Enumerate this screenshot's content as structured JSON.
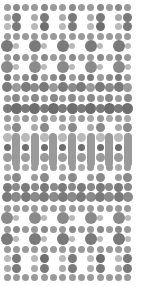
{
  "canvas": {
    "width": 146,
    "height": 285,
    "background": "#ffffff",
    "title": "grayscale-dot-matrix-pattern"
  },
  "grid": {
    "origin_x": 7,
    "origin_y": 7,
    "step_x": 9.3,
    "step_y": 9.4,
    "columns": 14,
    "rows": 29
  },
  "palette": {
    "light": "#b9b9b9",
    "light_mid": "#a9a9a9",
    "mid": "#9a9a9a",
    "mid_dark": "#8a8a8a",
    "dark": "#7a7a7a",
    "darkest": "#6e6e6e"
  },
  "chart_data": {
    "type": "heatmap",
    "xlabel": "",
    "ylabel": "",
    "categories": [
      "c0",
      "c1",
      "c2",
      "c3",
      "c4",
      "c5",
      "c6",
      "c7",
      "c8",
      "c9",
      "c10",
      "c11",
      "c12",
      "c13"
    ],
    "legend_position": "none",
    "grid": false,
    "note": "Each cell is a circle whose radius encodes size value and fill encodes tone value. Rows 14-16 contain vertical capsule glyphs in alternating columns.",
    "rows": [
      {
        "y": 7,
        "sizes": [
          7,
          7,
          7,
          7,
          7,
          7,
          7,
          7,
          7,
          7,
          7,
          7,
          7,
          7
        ],
        "tones": [
          "mid",
          "mid_dark",
          "mid",
          "mid",
          "mid_dark",
          "mid",
          "mid",
          "mid_dark",
          "mid",
          "mid",
          "mid_dark",
          "mid",
          "mid_dark",
          "mid"
        ]
      },
      {
        "y": 17,
        "sizes": [
          7,
          9,
          0,
          7,
          9,
          0,
          7,
          9,
          0,
          7,
          9,
          0,
          7,
          9
        ],
        "tones": [
          "light_mid",
          "dark",
          "none",
          "light_mid",
          "dark",
          "none",
          "light_mid",
          "dark",
          "none",
          "light_mid",
          "dark",
          "none",
          "light_mid",
          "dark"
        ]
      },
      {
        "y": 26,
        "sizes": [
          7,
          9,
          0,
          7,
          9,
          0,
          7,
          9,
          0,
          7,
          9,
          0,
          7,
          9
        ],
        "tones": [
          "light",
          "dark",
          "none",
          "light",
          "darkest",
          "none",
          "light",
          "dark",
          "none",
          "light",
          "darkest",
          "none",
          "light",
          "dark"
        ]
      },
      {
        "y": 36,
        "sizes": [
          7,
          7,
          7,
          7,
          7,
          7,
          7,
          7,
          7,
          7,
          7,
          7,
          7,
          7
        ],
        "tones": [
          "mid",
          "mid",
          "mid",
          "mid",
          "mid",
          "mid",
          "mid",
          "mid",
          "mid",
          "mid",
          "mid",
          "mid",
          "mid",
          "mid"
        ]
      },
      {
        "y": 46,
        "sizes": [
          12,
          6,
          0,
          12,
          6,
          0,
          12,
          6,
          0,
          12,
          6,
          0,
          12,
          6
        ],
        "tones": [
          "dark",
          "light",
          "none",
          "dark",
          "light",
          "none",
          "dark",
          "light",
          "none",
          "dark",
          "light",
          "none",
          "dark",
          "light"
        ]
      },
      {
        "y": 57,
        "sizes": [
          7,
          7,
          7,
          7,
          7,
          7,
          7,
          7,
          7,
          7,
          7,
          7,
          7,
          7
        ],
        "tones": [
          "mid",
          "mid_dark",
          "mid",
          "mid",
          "mid_dark",
          "mid",
          "mid",
          "mid_dark",
          "mid",
          "mid",
          "mid_dark",
          "mid",
          "mid_dark",
          "mid"
        ]
      },
      {
        "y": 67,
        "sizes": [
          12,
          6,
          0,
          12,
          6,
          0,
          12,
          6,
          0,
          12,
          6,
          0,
          12,
          6
        ],
        "tones": [
          "mid_dark",
          "light",
          "none",
          "mid_dark",
          "light",
          "none",
          "mid_dark",
          "light",
          "none",
          "mid_dark",
          "light",
          "none",
          "mid_dark",
          "light"
        ]
      },
      {
        "y": 77,
        "sizes": [
          7,
          7,
          7,
          7,
          7,
          7,
          7,
          7,
          7,
          7,
          7,
          7,
          7,
          7
        ],
        "tones": [
          "dark",
          "mid",
          "mid_dark",
          "dark",
          "mid",
          "mid_dark",
          "dark",
          "mid",
          "mid_dark",
          "dark",
          "mid",
          "mid_dark",
          "dark",
          "mid"
        ]
      },
      {
        "y": 87,
        "sizes": [
          10,
          9,
          10,
          9,
          10,
          9,
          10,
          9,
          10,
          9,
          10,
          9,
          10,
          9
        ],
        "tones": [
          "dark",
          "mid",
          "dark",
          "mid_dark",
          "dark",
          "mid",
          "dark",
          "mid_dark",
          "dark",
          "mid",
          "dark",
          "mid_dark",
          "dark",
          "mid"
        ]
      },
      {
        "y": 98,
        "sizes": [
          7,
          8,
          7,
          8,
          7,
          8,
          7,
          8,
          7,
          8,
          7,
          8,
          7,
          8
        ],
        "tones": [
          "mid",
          "mid_dark",
          "mid",
          "mid_dark",
          "mid",
          "mid_dark",
          "mid",
          "mid_dark",
          "mid",
          "mid_dark",
          "mid",
          "mid_dark",
          "mid",
          "mid_dark"
        ]
      },
      {
        "y": 108,
        "sizes": [
          9,
          11,
          9,
          11,
          9,
          11,
          9,
          11,
          9,
          11,
          9,
          11,
          9,
          11
        ],
        "tones": [
          "dark",
          "darkest",
          "dark",
          "darkest",
          "dark",
          "darkest",
          "dark",
          "darkest",
          "dark",
          "darkest",
          "dark",
          "darkest",
          "dark",
          "darkest"
        ]
      },
      {
        "y": 118,
        "sizes": [
          7,
          7,
          7,
          7,
          7,
          7,
          7,
          7,
          7,
          7,
          7,
          7,
          7,
          7
        ],
        "tones": [
          "mid",
          "light_mid",
          "mid",
          "light_mid",
          "mid",
          "light_mid",
          "mid",
          "light_mid",
          "mid",
          "light_mid",
          "mid",
          "light_mid",
          "mid",
          "light_mid"
        ]
      },
      {
        "y": 127,
        "sizes": [
          7,
          9,
          0,
          7,
          9,
          0,
          7,
          9,
          0,
          7,
          9,
          0,
          7,
          9
        ],
        "tones": [
          "light_mid",
          "mid_dark",
          "none",
          "light_mid",
          "mid_dark",
          "none",
          "light_mid",
          "mid_dark",
          "none",
          "light_mid",
          "mid_dark",
          "none",
          "light_mid",
          "mid_dark"
        ]
      },
      {
        "y": 137,
        "sizes": [
          9,
          0,
          9,
          0,
          9,
          0,
          9,
          0,
          9,
          0,
          9,
          0,
          9,
          0
        ],
        "tones": [
          "light",
          "none",
          "light",
          "none",
          "light",
          "none",
          "light",
          "none",
          "light",
          "none",
          "light",
          "none",
          "light",
          "none"
        ]
      },
      {
        "y": 147,
        "sizes": [
          7,
          0,
          7,
          0,
          7,
          0,
          7,
          0,
          7,
          0,
          7,
          0,
          7,
          0
        ],
        "tones": [
          "darkest",
          "none",
          "darkest",
          "none",
          "darkest",
          "none",
          "darkest",
          "none",
          "darkest",
          "none",
          "darkest",
          "none",
          "darkest",
          "none"
        ]
      },
      {
        "y": 157,
        "sizes": [
          9,
          0,
          9,
          0,
          9,
          0,
          9,
          0,
          9,
          0,
          9,
          0,
          9,
          0
        ],
        "tones": [
          "mid",
          "none",
          "mid",
          "none",
          "mid",
          "none",
          "mid",
          "none",
          "mid",
          "none",
          "mid",
          "none",
          "mid",
          "none"
        ]
      },
      {
        "y": 167,
        "sizes": [
          7,
          7,
          7,
          7,
          7,
          7,
          7,
          7,
          7,
          7,
          7,
          7,
          7,
          7
        ],
        "tones": [
          "light_mid",
          "mid",
          "light_mid",
          "mid",
          "light_mid",
          "mid",
          "light_mid",
          "mid",
          "light_mid",
          "mid",
          "light_mid",
          "mid",
          "light_mid",
          "mid"
        ]
      },
      {
        "y": 177,
        "sizes": [
          7,
          9,
          0,
          7,
          9,
          0,
          7,
          9,
          0,
          7,
          9,
          0,
          7,
          9
        ],
        "tones": [
          "mid",
          "mid_dark",
          "none",
          "mid",
          "mid_dark",
          "none",
          "mid",
          "mid_dark",
          "none",
          "mid",
          "mid_dark",
          "none",
          "mid",
          "mid_dark"
        ]
      },
      {
        "y": 187,
        "sizes": [
          9,
          8,
          9,
          8,
          9,
          8,
          9,
          8,
          9,
          8,
          9,
          8,
          9,
          8
        ],
        "tones": [
          "dark",
          "mid_dark",
          "dark",
          "mid_dark",
          "dark",
          "mid_dark",
          "dark",
          "mid_dark",
          "dark",
          "mid_dark",
          "dark",
          "mid_dark",
          "dark",
          "mid_dark"
        ]
      },
      {
        "y": 197,
        "sizes": [
          10,
          10,
          10,
          10,
          10,
          10,
          10,
          10,
          10,
          10,
          10,
          10,
          10,
          10
        ],
        "tones": [
          "dark",
          "mid_dark",
          "dark",
          "mid_dark",
          "dark",
          "mid_dark",
          "dark",
          "mid_dark",
          "dark",
          "mid_dark",
          "dark",
          "mid_dark",
          "dark",
          "mid_dark"
        ]
      },
      {
        "y": 208,
        "sizes": [
          7,
          7,
          7,
          7,
          7,
          7,
          7,
          7,
          7,
          7,
          7,
          7,
          7,
          7
        ],
        "tones": [
          "mid",
          "mid",
          "mid",
          "mid",
          "mid",
          "mid",
          "mid",
          "mid",
          "mid",
          "mid",
          "mid",
          "mid",
          "mid",
          "mid"
        ]
      },
      {
        "y": 218,
        "sizes": [
          12,
          6,
          0,
          12,
          6,
          0,
          12,
          6,
          0,
          12,
          6,
          0,
          12,
          6
        ],
        "tones": [
          "mid_dark",
          "light",
          "none",
          "mid_dark",
          "light",
          "none",
          "mid_dark",
          "light",
          "none",
          "mid_dark",
          "light",
          "none",
          "mid_dark",
          "light"
        ]
      },
      {
        "y": 229,
        "sizes": [
          7,
          7,
          7,
          7,
          7,
          7,
          7,
          7,
          7,
          7,
          7,
          7,
          7,
          7
        ],
        "tones": [
          "mid",
          "mid_dark",
          "mid",
          "mid",
          "mid_dark",
          "mid",
          "mid",
          "mid_dark",
          "mid",
          "mid",
          "mid_dark",
          "mid",
          "mid_dark",
          "mid"
        ]
      },
      {
        "y": 239,
        "sizes": [
          12,
          6,
          0,
          12,
          6,
          0,
          12,
          6,
          0,
          12,
          6,
          0,
          12,
          6
        ],
        "tones": [
          "dark",
          "light",
          "none",
          "dark",
          "light",
          "none",
          "dark",
          "light",
          "none",
          "dark",
          "light",
          "none",
          "dark",
          "light"
        ]
      },
      {
        "y": 249,
        "sizes": [
          7,
          7,
          7,
          7,
          7,
          7,
          7,
          7,
          7,
          7,
          7,
          7,
          7,
          7
        ],
        "tones": [
          "mid",
          "mid",
          "mid",
          "mid",
          "mid",
          "mid",
          "mid",
          "mid",
          "mid",
          "mid",
          "mid",
          "mid",
          "mid",
          "mid"
        ]
      },
      {
        "y": 258,
        "sizes": [
          7,
          9,
          0,
          7,
          9,
          0,
          7,
          9,
          0,
          7,
          9,
          0,
          7,
          9
        ],
        "tones": [
          "light",
          "dark",
          "none",
          "light",
          "darkest",
          "none",
          "light",
          "dark",
          "none",
          "light",
          "darkest",
          "none",
          "light",
          "dark"
        ]
      },
      {
        "y": 268,
        "sizes": [
          7,
          9,
          0,
          7,
          9,
          0,
          7,
          9,
          0,
          7,
          9,
          0,
          7,
          9
        ],
        "tones": [
          "light_mid",
          "dark",
          "none",
          "light_mid",
          "dark",
          "none",
          "light_mid",
          "dark",
          "none",
          "light_mid",
          "dark",
          "none",
          "light_mid",
          "dark"
        ]
      },
      {
        "y": 277,
        "sizes": [
          7,
          7,
          7,
          7,
          7,
          7,
          7,
          7,
          7,
          7,
          7,
          7,
          7,
          7
        ],
        "tones": [
          "mid",
          "mid",
          "mid",
          "mid",
          "mid",
          "mid",
          "mid",
          "mid",
          "mid",
          "mid",
          "mid",
          "mid",
          "mid",
          "mid"
        ]
      }
    ],
    "capsules": [
      {
        "col": 1,
        "x": 16,
        "y": 133,
        "width": 8,
        "height": 34,
        "tone": "mid"
      },
      {
        "col": 3,
        "x": 35,
        "y": 133,
        "width": 8,
        "height": 34,
        "tone": "mid"
      },
      {
        "col": 5,
        "x": 53,
        "y": 133,
        "width": 8,
        "height": 34,
        "tone": "mid"
      },
      {
        "col": 7,
        "x": 72,
        "y": 133,
        "width": 8,
        "height": 34,
        "tone": "mid"
      },
      {
        "col": 9,
        "x": 91,
        "y": 133,
        "width": 8,
        "height": 34,
        "tone": "mid"
      },
      {
        "col": 11,
        "x": 109,
        "y": 133,
        "width": 8,
        "height": 34,
        "tone": "mid"
      },
      {
        "col": 13,
        "x": 128,
        "y": 133,
        "width": 8,
        "height": 34,
        "tone": "mid"
      }
    ]
  }
}
